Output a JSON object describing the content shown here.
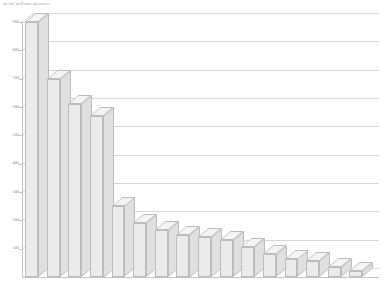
{
  "chart_data": {
    "type": "bar",
    "title": "",
    "subtitle": "en mil millones de euros",
    "xlabel": "",
    "ylabel": "",
    "ylim": [
      0,
      900
    ],
    "ytick_values": [
      900,
      800,
      700,
      600,
      500,
      400,
      300,
      200,
      100
    ],
    "ytick_labels": [
      "900",
      "800",
      "700",
      "600",
      "500",
      "400",
      "300",
      "200",
      "100"
    ],
    "grid": true,
    "legend": "none",
    "style": "3d-bar",
    "categories": [
      "",
      "",
      "",
      "",
      "",
      "",
      "",
      "",
      "",
      "",
      "",
      "",
      "",
      "",
      "",
      ""
    ],
    "values": [
      900,
      700,
      610,
      570,
      250,
      190,
      165,
      150,
      140,
      130,
      105,
      80,
      65,
      55,
      35,
      20
    ],
    "series": [
      {
        "name": "",
        "values": [
          900,
          700,
          610,
          570,
          250,
          190,
          165,
          150,
          140,
          130,
          105,
          80,
          65,
          55,
          35,
          20
        ]
      }
    ]
  },
  "axis": {
    "y_ticks": [
      "900",
      "800",
      "700",
      "600",
      "500",
      "400",
      "300",
      "200",
      "100"
    ],
    "x_ticks": [
      "",
      "",
      "",
      "",
      "",
      "",
      "",
      "",
      "",
      "",
      "",
      "",
      "",
      "",
      "",
      ""
    ]
  },
  "colors": {
    "bar_face": "#ebebeb",
    "bar_top": "#f4f4f4",
    "bar_side": "#e0e0e0",
    "bar_edge": "#bcbcbc",
    "grid": "#c9c9c9",
    "axis": "#b4b4b4",
    "text": "#8f8f8f",
    "background": "#ffffff"
  }
}
